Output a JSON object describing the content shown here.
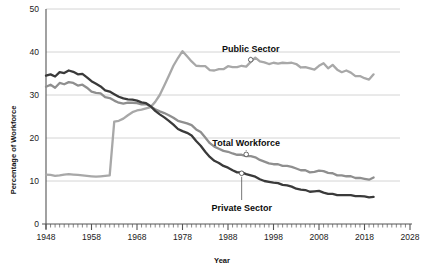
{
  "chart_data": {
    "type": "line",
    "title": "",
    "xlabel": "Year",
    "ylabel": "Percentage of Workforce",
    "xlim": [
      1948,
      2028
    ],
    "ylim": [
      0,
      50
    ],
    "xticks": [
      1948,
      1958,
      1968,
      1978,
      1988,
      1998,
      2008,
      2018,
      2028
    ],
    "yticks": [
      0,
      10,
      20,
      30,
      40,
      50
    ],
    "grid": "horizontal",
    "legend": "inline-annotations",
    "annotations": [
      {
        "label": "Public Sector",
        "year": 1993,
        "value": 38.2
      },
      {
        "label": "Total  Workforce",
        "year": 1992,
        "value": 16.2
      },
      {
        "label": "Private Sector",
        "year": 1991,
        "value": 11.8
      }
    ],
    "series": [
      {
        "name": "Public Sector",
        "color": "#a8a8a8",
        "x": [
          1948,
          1949,
          1950,
          1951,
          1952,
          1953,
          1954,
          1955,
          1956,
          1957,
          1958,
          1959,
          1960,
          1961,
          1962,
          1963,
          1964,
          1965,
          1966,
          1967,
          1968,
          1969,
          1970,
          1971,
          1972,
          1973,
          1974,
          1975,
          1976,
          1977,
          1978,
          1979,
          1980,
          1981,
          1982,
          1983,
          1984,
          1985,
          1986,
          1987,
          1988,
          1989,
          1990,
          1991,
          1992,
          1993,
          1994,
          1995,
          1996,
          1997,
          1998,
          1999,
          2000,
          2001,
          2002,
          2003,
          2004,
          2005,
          2006,
          2007,
          2008,
          2009,
          2010,
          2011,
          2012,
          2013,
          2014,
          2015,
          2016,
          2017,
          2018,
          2019,
          2020
        ],
        "values": [
          11.5,
          11.4,
          11.2,
          11.3,
          11.5,
          11.6,
          11.5,
          11.4,
          11.3,
          11.2,
          11.1,
          11.0,
          11.1,
          11.2,
          11.3,
          23.8,
          24.0,
          24.5,
          25.3,
          26.0,
          26.4,
          26.6,
          26.9,
          27.2,
          28.4,
          30.0,
          32.2,
          34.5,
          36.8,
          38.6,
          40.2,
          39.0,
          37.8,
          36.8,
          36.7,
          36.7,
          35.8,
          35.7,
          36.0,
          36.0,
          36.7,
          36.5,
          36.5,
          36.8,
          36.6,
          37.7,
          38.7,
          37.8,
          37.6,
          37.2,
          37.5,
          37.3,
          37.5,
          37.4,
          37.5,
          37.2,
          36.4,
          36.5,
          36.2,
          35.9,
          36.8,
          37.4,
          36.2,
          37.0,
          35.9,
          35.3,
          35.7,
          35.2,
          34.4,
          34.4,
          33.9,
          33.6,
          34.8
        ]
      },
      {
        "name": "Total Workforce",
        "color": "#8f8f8f",
        "x": [
          1948,
          1949,
          1950,
          1951,
          1952,
          1953,
          1954,
          1955,
          1956,
          1957,
          1958,
          1959,
          1960,
          1961,
          1962,
          1963,
          1964,
          1965,
          1966,
          1967,
          1968,
          1969,
          1970,
          1971,
          1972,
          1973,
          1974,
          1975,
          1976,
          1977,
          1978,
          1979,
          1980,
          1981,
          1982,
          1983,
          1984,
          1985,
          1986,
          1987,
          1988,
          1989,
          1990,
          1991,
          1992,
          1993,
          1994,
          1995,
          1996,
          1997,
          1998,
          1999,
          2000,
          2001,
          2002,
          2003,
          2004,
          2005,
          2006,
          2007,
          2008,
          2009,
          2010,
          2011,
          2012,
          2013,
          2014,
          2015,
          2016,
          2017,
          2018,
          2019,
          2020
        ],
        "values": [
          31.9,
          32.4,
          31.7,
          32.8,
          32.5,
          33.0,
          32.8,
          32.2,
          32.4,
          31.7,
          30.8,
          30.5,
          30.4,
          29.5,
          29.3,
          28.7,
          28.2,
          28.0,
          28.2,
          28.2,
          28.1,
          27.8,
          27.9,
          27.3,
          26.7,
          26.2,
          25.8,
          25.3,
          24.7,
          24.0,
          23.7,
          23.4,
          23.0,
          22.0,
          21.4,
          20.1,
          18.8,
          18.0,
          17.5,
          17.0,
          16.8,
          16.4,
          16.1,
          16.1,
          15.8,
          15.8,
          15.5,
          14.9,
          14.5,
          14.1,
          13.9,
          13.9,
          13.5,
          13.5,
          13.3,
          12.9,
          12.5,
          12.5,
          12.0,
          12.1,
          12.4,
          12.3,
          11.9,
          11.8,
          11.3,
          11.3,
          11.1,
          11.1,
          10.7,
          10.7,
          10.5,
          10.3,
          10.8
        ]
      },
      {
        "name": "Private Sector",
        "color": "#3a3a3a",
        "x": [
          1948,
          1949,
          1950,
          1951,
          1952,
          1953,
          1954,
          1955,
          1956,
          1957,
          1958,
          1959,
          1960,
          1961,
          1962,
          1963,
          1964,
          1965,
          1966,
          1967,
          1968,
          1969,
          1970,
          1971,
          1972,
          1973,
          1974,
          1975,
          1976,
          1977,
          1978,
          1979,
          1980,
          1981,
          1982,
          1983,
          1984,
          1985,
          1986,
          1987,
          1988,
          1989,
          1990,
          1991,
          1992,
          1993,
          1994,
          1995,
          1996,
          1997,
          1998,
          1999,
          2000,
          2001,
          2002,
          2003,
          2004,
          2005,
          2006,
          2007,
          2008,
          2009,
          2010,
          2011,
          2012,
          2013,
          2014,
          2015,
          2016,
          2017,
          2018,
          2019,
          2020
        ],
        "values": [
          34.5,
          34.8,
          34.3,
          35.3,
          35.1,
          35.7,
          35.4,
          34.8,
          34.9,
          34.1,
          33.2,
          32.6,
          32.0,
          31.1,
          30.8,
          30.2,
          29.6,
          29.2,
          29.0,
          28.9,
          28.7,
          28.3,
          28.1,
          27.4,
          26.3,
          25.5,
          24.8,
          24.0,
          23.1,
          22.1,
          21.6,
          21.2,
          20.6,
          19.3,
          18.2,
          16.8,
          15.6,
          14.7,
          14.2,
          13.5,
          13.1,
          12.5,
          12.0,
          12.0,
          11.6,
          11.3,
          11.0,
          10.4,
          10.0,
          9.8,
          9.6,
          9.5,
          9.1,
          9.0,
          8.7,
          8.2,
          8.0,
          7.9,
          7.5,
          7.6,
          7.7,
          7.3,
          7.0,
          7.0,
          6.7,
          6.7,
          6.7,
          6.7,
          6.5,
          6.5,
          6.4,
          6.2,
          6.3
        ]
      }
    ]
  },
  "axes": {
    "y_label": "Percentage of Workforce",
    "x_label": "Year",
    "y_tick_labels": [
      "50",
      "40",
      "30",
      "20",
      "10",
      "0"
    ],
    "x_tick_labels": [
      "1948",
      "1958",
      "1968",
      "1978",
      "1988",
      "1998",
      "2008",
      "2018",
      "2028"
    ]
  },
  "annotations": {
    "public": "Public Sector",
    "total": "Total  Workforce",
    "private": "Private Sector"
  },
  "colors": {
    "public": "#a8a8a8",
    "total": "#8f8f8f",
    "private": "#3a3a3a",
    "grid": "#c9c9c9",
    "axis": "#555555",
    "text": "#111111",
    "background": "#ffffff"
  }
}
